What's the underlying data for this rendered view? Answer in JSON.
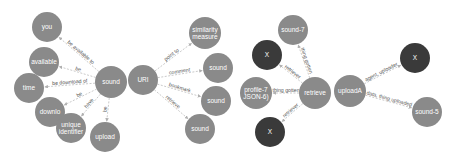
{
  "colors": {
    "node_gray": "#8a8a8a",
    "node_dark": "#3a3a3a",
    "edge": "#c4c4c4",
    "edge_text": "#555555",
    "node_text": "#ffffff",
    "background": "#ffffff"
  },
  "graphs": [
    {
      "id": "graph-sound",
      "nodes": [
        {
          "id": "n_sound",
          "lines": [
            "sound"
          ],
          "x": 111,
          "y": 82,
          "r": 16,
          "style": "gray"
        },
        {
          "id": "n_you",
          "lines": [
            "you"
          ],
          "x": 47,
          "y": 27,
          "r": 15,
          "style": "gray"
        },
        {
          "id": "n_available",
          "lines": [
            "available"
          ],
          "x": 44,
          "y": 62,
          "r": 15,
          "style": "gray"
        },
        {
          "id": "n_time",
          "lines": [
            "time"
          ],
          "x": 29,
          "y": 88,
          "r": 15,
          "style": "gray"
        },
        {
          "id": "n_download",
          "lines": [
            "downlo"
          ],
          "x": 50,
          "y": 112,
          "r": 15,
          "style": "gray"
        },
        {
          "id": "n_unique",
          "lines": [
            "unique",
            "identifier"
          ],
          "x": 71,
          "y": 128,
          "r": 15,
          "style": "gray"
        },
        {
          "id": "n_upload",
          "lines": [
            "upload"
          ],
          "x": 105,
          "y": 137,
          "r": 15,
          "style": "gray"
        }
      ],
      "edges": [
        {
          "from": "n_sound",
          "to": "n_you",
          "label": "be available to"
        },
        {
          "from": "n_sound",
          "to": "n_available",
          "label": "be"
        },
        {
          "from": "n_sound",
          "to": "n_time",
          "label": "be download of"
        },
        {
          "from": "n_sound",
          "to": "n_download",
          "label": "be"
        },
        {
          "from": "n_sound",
          "to": "n_unique",
          "label": "have"
        },
        {
          "from": "n_sound",
          "to": "n_upload",
          "label": "be"
        }
      ]
    },
    {
      "id": "graph-uri",
      "nodes": [
        {
          "id": "n_uri",
          "lines": [
            "URI"
          ],
          "x": 143,
          "y": 80,
          "r": 15,
          "style": "gray"
        },
        {
          "id": "n_similarity",
          "lines": [
            "similarity",
            "measure"
          ],
          "x": 205,
          "y": 33,
          "r": 16,
          "style": "gray"
        },
        {
          "id": "n_sound_a",
          "lines": [
            "sound"
          ],
          "x": 218,
          "y": 68,
          "r": 15,
          "style": "gray"
        },
        {
          "id": "n_sound_b",
          "lines": [
            "sound"
          ],
          "x": 216,
          "y": 101,
          "r": 15,
          "style": "gray"
        },
        {
          "id": "n_sound_c",
          "lines": [
            "sound"
          ],
          "x": 200,
          "y": 129,
          "r": 15,
          "style": "gray"
        }
      ],
      "edges": [
        {
          "from": "n_uri",
          "to": "n_similarity",
          "label": "point to"
        },
        {
          "from": "n_uri",
          "to": "n_sound_a",
          "label": "comment"
        },
        {
          "from": "n_uri",
          "to": "n_sound_b",
          "label": "bookmark"
        },
        {
          "from": "n_uri",
          "to": "n_sound_c",
          "label": "retrieve"
        }
      ]
    },
    {
      "id": "graph-retrieve",
      "nodes": [
        {
          "id": "n_retrieve",
          "lines": [
            "retrieve"
          ],
          "x": 315,
          "y": 93,
          "r": 16,
          "style": "gray"
        },
        {
          "id": "n_sound7",
          "lines": [
            "sound-7"
          ],
          "x": 293,
          "y": 30,
          "r": 15,
          "style": "gray"
        },
        {
          "id": "n_x1",
          "lines": [
            "X"
          ],
          "x": 267,
          "y": 55,
          "r": 15,
          "style": "dark"
        },
        {
          "id": "n_profile",
          "lines": [
            "profile-7",
            "JSON-6)"
          ],
          "x": 256,
          "y": 93,
          "r": 16,
          "style": "gray"
        },
        {
          "id": "n_x2",
          "lines": [
            "X"
          ],
          "x": 270,
          "y": 132,
          "r": 15,
          "style": "dark"
        }
      ],
      "edges": [
        {
          "from": "n_retrieve",
          "to": "n_sound7",
          "label": "thing gotten"
        },
        {
          "from": "n_retrieve",
          "to": "n_x1",
          "label": "retriever"
        },
        {
          "from": "n_retrieve",
          "to": "n_profile",
          "label": "thing gotten"
        },
        {
          "from": "n_retrieve",
          "to": "n_x2",
          "label": "retriever"
        }
      ]
    },
    {
      "id": "graph-upload",
      "nodes": [
        {
          "id": "n_uploadA",
          "lines": [
            "uploadA"
          ],
          "x": 350,
          "y": 91,
          "r": 16,
          "style": "gray"
        },
        {
          "id": "n_x3",
          "lines": [
            "X"
          ],
          "x": 415,
          "y": 58,
          "r": 15,
          "style": "dark"
        },
        {
          "id": "n_sound5",
          "lines": [
            "sound-5"
          ],
          "x": 427,
          "y": 112,
          "r": 15,
          "style": "gray"
        }
      ],
      "edges": [
        {
          "from": "n_uploadA",
          "to": "n_x3",
          "label": "agent, uploader"
        },
        {
          "from": "n_uploadA",
          "to": "n_sound5",
          "label": "data, thing uploaded"
        }
      ]
    }
  ]
}
